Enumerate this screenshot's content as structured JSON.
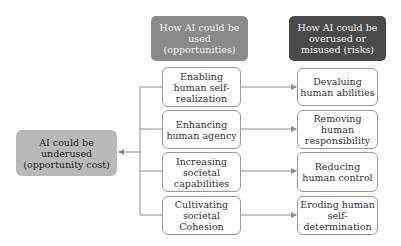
{
  "headers": {
    "opportunities": "How AI could be used (opportunities)",
    "risks": "How AI could be overused or misused (risks)"
  },
  "underuse_box": "AI could be underused (opportunity cost)",
  "opportunities": [
    "Enabling human self-realization",
    "Enhancing human agency",
    "Increasing societal capabilities",
    "Cultivating societal Cohesion"
  ],
  "risks": [
    "Devaluing human abilities",
    "Removing human responsibility",
    "Reducing human control",
    "Eroding human self-determination"
  ],
  "colors": {
    "header_opportunities": "#8a8a8a",
    "header_risks": "#4a4a4a",
    "underuse_box": "#b9b9b9",
    "line": "#8c8c8c"
  }
}
